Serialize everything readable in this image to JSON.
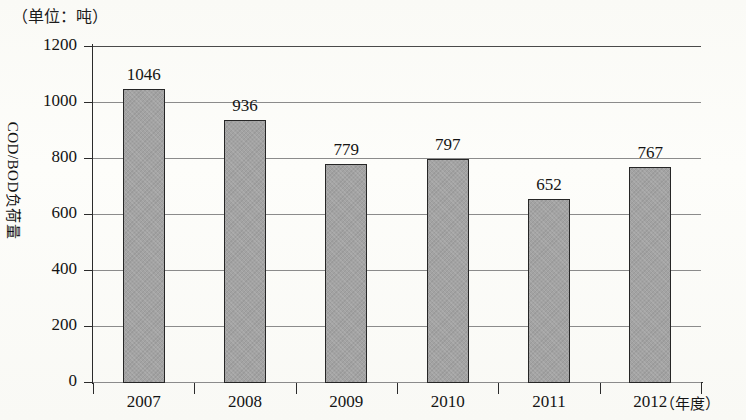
{
  "unit_caption": "（单位：吨）",
  "y_axis_title": "COD/BOD负荷量",
  "x_axis_unit": "（年度）",
  "y_ticks": [
    "1200",
    "1000",
    "800",
    "600",
    "400",
    "200",
    "0"
  ],
  "x_ticks": [
    "2007",
    "2008",
    "2009",
    "2010",
    "2011",
    "2012"
  ],
  "bar_labels": [
    "1046",
    "936",
    "779",
    "797",
    "652",
    "767"
  ],
  "colors": {
    "bar_fill": "#a3a3a3",
    "bar_border": "#262626",
    "gridline": "#8b8b8b",
    "axis": "#2b2b2b",
    "text": "#141414",
    "background": "#fdfdfb"
  },
  "chart_data": {
    "type": "bar",
    "title": "",
    "subtitle": "",
    "unit": "吨",
    "categories": [
      "2007",
      "2008",
      "2009",
      "2010",
      "2011",
      "2012"
    ],
    "values": [
      1046,
      936,
      779,
      797,
      652,
      767
    ],
    "series": [
      {
        "name": "COD/BOD负荷量",
        "values": [
          1046,
          936,
          779,
          797,
          652,
          767
        ]
      }
    ],
    "xlabel": "（年度）",
    "ylabel": "COD/BOD负荷量",
    "ylim": [
      0,
      1200
    ],
    "ytick_values": [
      0,
      200,
      400,
      600,
      800,
      1000,
      1200
    ],
    "grid": true,
    "grid_axis": "y",
    "legend": false,
    "data_labels": true
  }
}
